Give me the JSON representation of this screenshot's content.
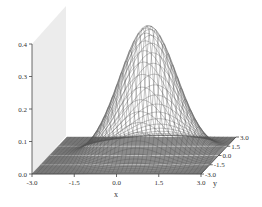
{
  "chart_data": {
    "type": "surface",
    "title": "",
    "xlabel": "x",
    "ylabel": "y",
    "zlabel": "",
    "xlim": [
      -3.0,
      3.0
    ],
    "ylim": [
      -3.0,
      3.0
    ],
    "zlim": [
      0.0,
      0.4
    ],
    "x_ticks": [
      "-3.0",
      "-1.5",
      "0.0",
      "1.5",
      "3.0"
    ],
    "y_ticks": [
      "-3.0",
      "-1.5",
      "0.0",
      "1.5",
      "3.0"
    ],
    "z_ticks": [
      "0.0",
      "0.1",
      "0.2",
      "0.3",
      "0.4"
    ],
    "surface": {
      "function": "bivariate_normal",
      "mean": [
        0.5,
        0.0
      ],
      "peak_value": 0.4,
      "grid_lines": 40
    },
    "colors": {
      "wire": "#555555",
      "floor_dark": "#6a6a6a",
      "back_wall": "#e8e8e8",
      "axis": "#444444"
    }
  }
}
